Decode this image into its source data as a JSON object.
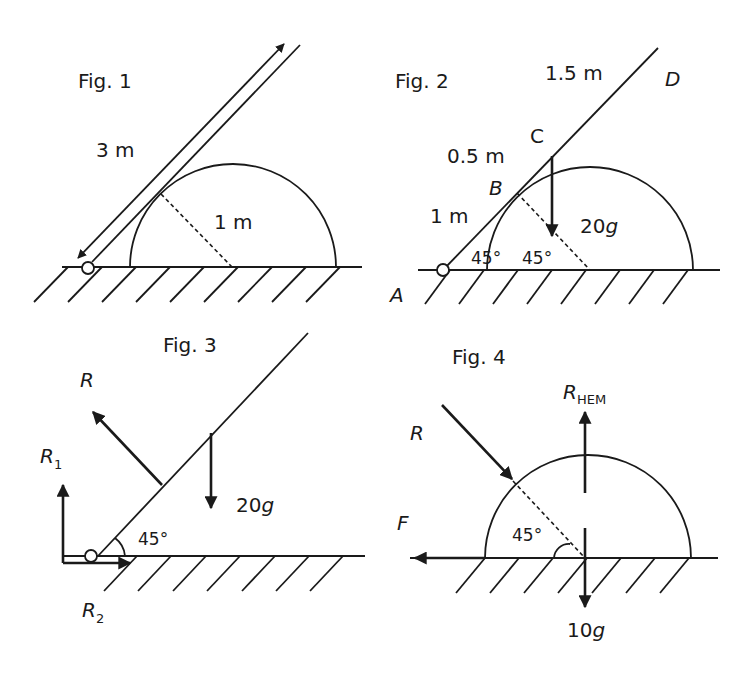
{
  "figures": [
    {
      "id": "fig1",
      "title": "Fig. 1",
      "labels": {
        "rod_length": "3 m",
        "radius": "1 m"
      }
    },
    {
      "id": "fig2",
      "title": "Fig. 2",
      "labels": {
        "segment_CD": "1.5 m",
        "segment_BC": "0.5 m",
        "segment_AB": "1 m",
        "point_A": "A",
        "point_B": "B",
        "point_C": "C",
        "point_D": "D",
        "angle_rod": "45°",
        "angle_radius": "45°",
        "weight": "20g"
      }
    },
    {
      "id": "fig3",
      "title": "Fig. 3",
      "labels": {
        "normal_reaction": "R",
        "reaction_vertical": "R",
        "reaction_vertical_sub": "1",
        "reaction_horizontal": "R",
        "reaction_horizontal_sub": "2",
        "weight": "20g",
        "angle": "45°"
      }
    },
    {
      "id": "fig4",
      "title": "Fig. 4",
      "labels": {
        "reaction_from_rod": "R",
        "reaction_hemisphere": "R",
        "reaction_hemisphere_sub": "HEM",
        "friction": "F",
        "weight": "10g",
        "angle": "45°"
      }
    }
  ],
  "colors": {
    "ink": "#1a1a1a",
    "background": "#ffffff"
  }
}
